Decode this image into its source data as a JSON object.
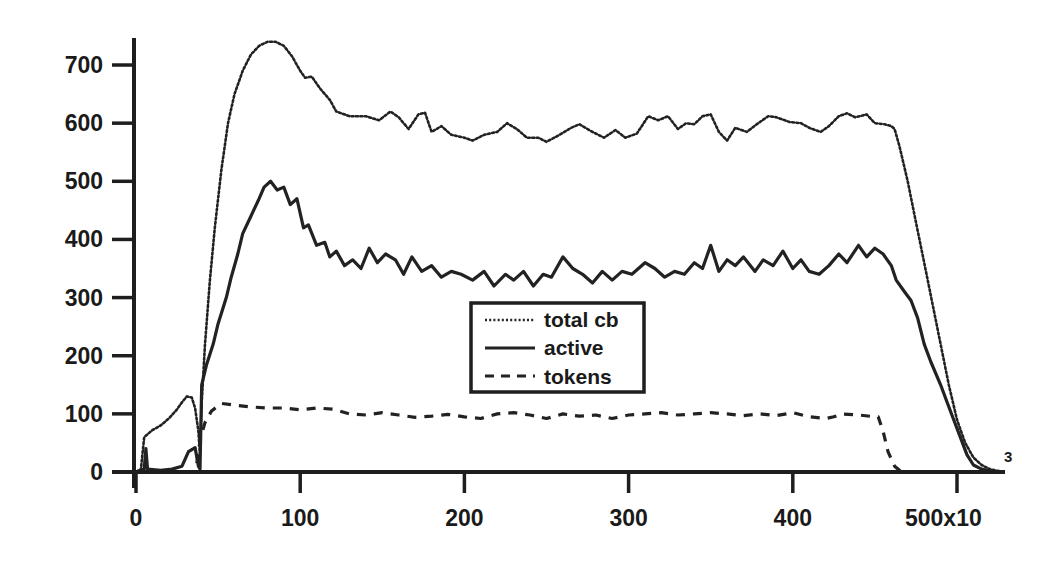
{
  "chart_data": {
    "type": "line",
    "title": "",
    "xlabel": "",
    "ylabel": "",
    "x_tick_labels": [
      "0",
      "100",
      "200",
      "300",
      "400",
      "500x10"
    ],
    "x_tick_values": [
      0,
      100,
      200,
      300,
      400,
      500
    ],
    "x_exponent_label": "3",
    "x_multiplier": 1000,
    "y_tick_labels": [
      "0",
      "100",
      "200",
      "300",
      "400",
      "500",
      "600",
      "700"
    ],
    "y_tick_values": [
      0,
      100,
      200,
      300,
      400,
      500,
      600,
      700
    ],
    "xlim": [
      0,
      530
    ],
    "ylim": [
      0,
      760
    ],
    "grid": false,
    "legend_position": "center (inside plot, below active curve)",
    "series": [
      {
        "name": "total cb",
        "style": "dotted",
        "color": "#222222",
        "x": [
          0,
          3,
          5,
          10,
          15,
          20,
          25,
          28,
          31,
          34,
          36,
          38,
          39,
          40,
          42,
          45,
          48,
          52,
          56,
          60,
          65,
          70,
          75,
          80,
          85,
          90,
          95,
          100,
          103,
          107,
          112,
          118,
          122,
          130,
          140,
          148,
          155,
          160,
          166,
          172,
          176,
          180,
          186,
          192,
          200,
          205,
          212,
          220,
          226,
          232,
          238,
          245,
          250,
          258,
          265,
          270,
          278,
          285,
          292,
          298,
          305,
          312,
          318,
          324,
          330,
          335,
          340,
          345,
          350,
          355,
          360,
          365,
          372,
          378,
          385,
          390,
          398,
          405,
          410,
          417,
          422,
          428,
          433,
          438,
          445,
          450,
          456,
          460,
          462,
          465,
          470,
          475,
          480,
          485,
          490,
          495,
          500,
          505,
          510,
          515,
          520,
          528
        ],
        "values": [
          0,
          5,
          60,
          72,
          80,
          92,
          108,
          120,
          130,
          128,
          110,
          70,
          30,
          120,
          220,
          330,
          420,
          520,
          600,
          650,
          690,
          718,
          733,
          740,
          740,
          733,
          715,
          690,
          678,
          680,
          660,
          640,
          620,
          612,
          612,
          605,
          620,
          610,
          590,
          615,
          618,
          585,
          595,
          580,
          575,
          570,
          580,
          585,
          600,
          590,
          575,
          575,
          568,
          580,
          592,
          598,
          585,
          575,
          588,
          575,
          582,
          612,
          605,
          612,
          590,
          600,
          598,
          612,
          615,
          585,
          570,
          592,
          585,
          598,
          612,
          610,
          602,
          600,
          592,
          585,
          595,
          612,
          617,
          610,
          615,
          600,
          598,
          595,
          590,
          560,
          500,
          430,
          360,
          290,
          220,
          150,
          90,
          50,
          25,
          12,
          5,
          0
        ]
      },
      {
        "name": "active",
        "style": "solid",
        "color": "#222222",
        "x": [
          0,
          5,
          6,
          7,
          15,
          22,
          28,
          32,
          36,
          38,
          39,
          40,
          43,
          47,
          50,
          55,
          58,
          62,
          65,
          70,
          75,
          78,
          82,
          86,
          90,
          94,
          98,
          102,
          105,
          110,
          115,
          118,
          122,
          127,
          132,
          137,
          142,
          147,
          152,
          158,
          163,
          168,
          174,
          180,
          186,
          192,
          198,
          205,
          212,
          218,
          225,
          230,
          236,
          242,
          248,
          253,
          260,
          266,
          272,
          278,
          284,
          290,
          296,
          302,
          310,
          316,
          322,
          328,
          334,
          340,
          345,
          350,
          355,
          360,
          365,
          370,
          377,
          382,
          388,
          394,
          400,
          405,
          410,
          416,
          422,
          428,
          433,
          440,
          445,
          450,
          455,
          460,
          463,
          468,
          472,
          476,
          480,
          484,
          490,
          494,
          498,
          502,
          506,
          510,
          515,
          520,
          528
        ],
        "values": [
          0,
          5,
          40,
          5,
          3,
          5,
          10,
          35,
          42,
          10,
          5,
          150,
          185,
          220,
          255,
          300,
          335,
          375,
          410,
          440,
          470,
          490,
          500,
          485,
          490,
          460,
          470,
          420,
          425,
          390,
          395,
          370,
          380,
          355,
          365,
          350,
          385,
          360,
          375,
          365,
          340,
          370,
          345,
          355,
          335,
          345,
          340,
          330,
          345,
          320,
          340,
          330,
          345,
          320,
          340,
          335,
          370,
          350,
          340,
          325,
          345,
          330,
          345,
          340,
          360,
          350,
          335,
          345,
          340,
          360,
          350,
          390,
          345,
          365,
          355,
          370,
          345,
          365,
          355,
          380,
          350,
          365,
          345,
          340,
          355,
          375,
          360,
          390,
          370,
          385,
          375,
          355,
          330,
          310,
          295,
          265,
          220,
          190,
          150,
          120,
          90,
          60,
          30,
          12,
          5,
          2,
          0
        ]
      },
      {
        "name": "tokens",
        "style": "dashed",
        "color": "#222222",
        "x": [
          0,
          36,
          38,
          39,
          42,
          46,
          52,
          60,
          70,
          80,
          90,
          100,
          110,
          120,
          130,
          140,
          150,
          160,
          170,
          180,
          190,
          200,
          210,
          220,
          230,
          240,
          250,
          260,
          270,
          280,
          290,
          300,
          310,
          320,
          330,
          340,
          350,
          360,
          370,
          380,
          390,
          400,
          410,
          420,
          425,
          430,
          440,
          450,
          452,
          455,
          458,
          462,
          465,
          470,
          528
        ],
        "values": [
          0,
          0,
          30,
          55,
          85,
          105,
          118,
          115,
          112,
          110,
          110,
          107,
          110,
          108,
          100,
          98,
          102,
          98,
          94,
          96,
          99,
          95,
          92,
          100,
          102,
          98,
          92,
          100,
          96,
          98,
          92,
          98,
          100,
          102,
          98,
          100,
          102,
          100,
          97,
          100,
          97,
          102,
          95,
          92,
          95,
          100,
          98,
          95,
          95,
          70,
          35,
          10,
          3,
          0,
          0
        ]
      }
    ]
  },
  "legend": {
    "items": [
      {
        "label": "total cb",
        "style": "dotted"
      },
      {
        "label": "active",
        "style": "solid"
      },
      {
        "label": "tokens",
        "style": "dashed"
      }
    ]
  },
  "axes": {
    "x_ticks": [
      "0",
      "100",
      "200",
      "300",
      "400",
      "500x10"
    ],
    "x_exponent": "3",
    "y_ticks": [
      "0",
      "100",
      "200",
      "300",
      "400",
      "500",
      "600",
      "700"
    ]
  }
}
